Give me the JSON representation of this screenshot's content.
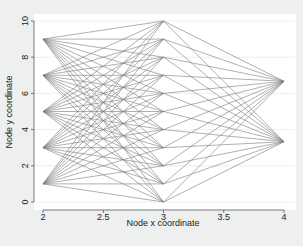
{
  "chart_data": {
    "type": "network",
    "title": "",
    "xlabel": "Node x coordinate",
    "ylabel": "Node y coordinate",
    "xlim": [
      2,
      4
    ],
    "ylim": [
      0,
      10
    ],
    "xticks": [
      2,
      2.5,
      3,
      3.5,
      4
    ],
    "xtick_labels": [
      "2",
      "2.5",
      "3",
      "3.5",
      "4"
    ],
    "yticks": [
      0,
      2,
      4,
      6,
      8,
      10
    ],
    "ytick_labels": [
      "0",
      "2",
      "4",
      "6",
      "8",
      "10"
    ],
    "grid": "horizontal",
    "nodes": {
      "left": {
        "x": 2,
        "y": [
          1,
          3,
          5,
          7,
          9
        ]
      },
      "center": {
        "x": 3,
        "y": [
          0,
          1,
          2,
          3,
          4,
          5,
          6,
          7,
          8,
          9,
          10
        ]
      },
      "right": {
        "x": 4,
        "y": [
          3.33,
          6.67
        ]
      }
    },
    "edges": "complete bipartite: every left node to every center node; every center node to every right node",
    "colors": {
      "edge": "#7a7a7a",
      "plot_background": "#ffffff",
      "figure_background": "#eef0f0",
      "grid": "#eaeaea",
      "axis": "#555555"
    }
  }
}
